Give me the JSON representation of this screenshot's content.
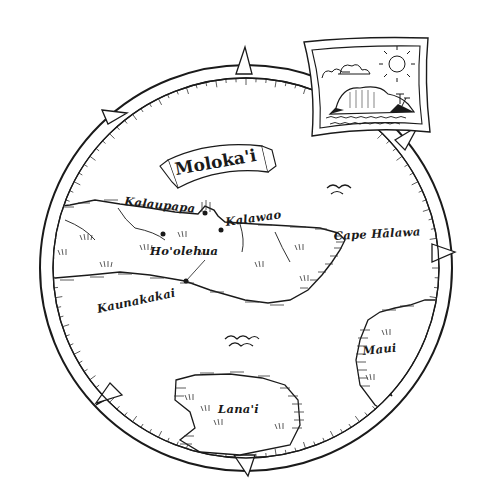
{
  "map": {
    "title": "Moloka'i",
    "style": "hand-drawn ink illustration",
    "colors": {
      "ink": "#1a1a1a",
      "paper": "#ffffff",
      "hatch": "#444444"
    },
    "places": [
      {
        "id": "kalaupapa",
        "label": "Kalaupapa",
        "type": "settlement"
      },
      {
        "id": "kalawao",
        "label": "Kalawao",
        "type": "settlement"
      },
      {
        "id": "hoolehua",
        "label": "Ho'olehua",
        "type": "settlement"
      },
      {
        "id": "kaunakakai",
        "label": "Kaunakakai",
        "type": "settlement"
      },
      {
        "id": "cape-halawa",
        "label": "Cape Hālawa",
        "type": "cape"
      }
    ],
    "islands": [
      {
        "id": "molokai",
        "label": "Moloka'i"
      },
      {
        "id": "maui",
        "label": "Maui"
      },
      {
        "id": "lanai",
        "label": "Lana'i"
      }
    ],
    "compass_markers": [
      "north",
      "northeast",
      "east",
      "southeast",
      "south",
      "southwest",
      "west-northwest"
    ],
    "inset": {
      "description": "framed picture of island cliff with palm trees, clouds, sun and ocean waves"
    }
  },
  "labels": {
    "title": "Moloka'i",
    "kalaupapa": "Kalaupapa",
    "kalawao": "Kalawao",
    "hoolehua": "Ho'olehua",
    "kaunakakai": "Kaunakakai",
    "cape_halawa": "Cape Hālawa",
    "maui": "Maui",
    "lanai": "Lana'i"
  }
}
